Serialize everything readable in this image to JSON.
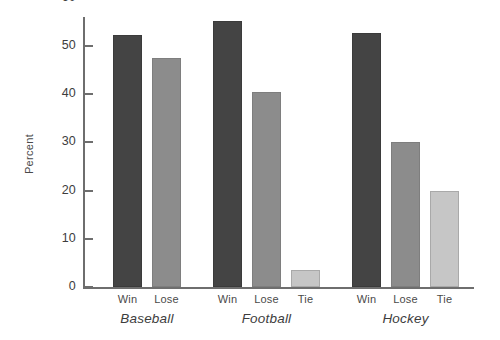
{
  "chart_data": {
    "type": "bar",
    "title": "",
    "xlabel": "",
    "ylabel": "Percent",
    "ylim": [
      0,
      65
    ],
    "yticks": [
      0,
      10,
      20,
      30,
      40,
      50,
      60
    ],
    "grid": false,
    "legend": "none",
    "categories": [
      "Baseball",
      "Football",
      "Hockey"
    ],
    "series_labels": [
      "Win",
      "Lose",
      "Tie"
    ],
    "groups": [
      {
        "name": "Baseball",
        "bars": [
          {
            "label": "Win",
            "value": 52.2,
            "color": "#444444",
            "shade": "dark"
          },
          {
            "label": "Lose",
            "value": 47.5,
            "color": "#8c8c8c",
            "shade": "medium"
          }
        ]
      },
      {
        "name": "Football",
        "bars": [
          {
            "label": "Win",
            "value": 55.2,
            "color": "#444444",
            "shade": "dark"
          },
          {
            "label": "Lose",
            "value": 40.5,
            "color": "#8c8c8c",
            "shade": "medium"
          },
          {
            "label": "Tie",
            "value": 3.5,
            "color": "#c6c6c6",
            "shade": "light"
          }
        ]
      },
      {
        "name": "Hockey",
        "bars": [
          {
            "label": "Win",
            "value": 52.7,
            "color": "#444444",
            "shade": "dark"
          },
          {
            "label": "Lose",
            "value": 30.0,
            "color": "#8c8c8c",
            "shade": "medium"
          },
          {
            "label": "Tie",
            "value": 20.0,
            "color": "#c6c6c6",
            "shade": "light"
          }
        ]
      }
    ],
    "colors": {
      "win": "#444444",
      "lose": "#8c8c8c",
      "tie": "#c6c6c6",
      "axis": "#6e6e6e",
      "text": "#3d3d3d",
      "background": "#ffffff"
    }
  },
  "axis": {
    "y_title": "Percent"
  }
}
